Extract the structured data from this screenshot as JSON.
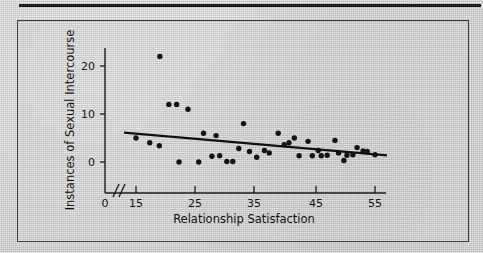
{
  "figure": {
    "background_color": "#cccccc",
    "panel_border_color": "#3a3a3a",
    "rule_color": "#1d1d1d",
    "ink_color": "#141414"
  },
  "chart_data": {
    "type": "scatter",
    "title": "",
    "xlabel": "Relationship Satisfaction",
    "ylabel": "Instances of Sexual Intercourse",
    "xlim": [
      12,
      58
    ],
    "ylim": [
      -4,
      24
    ],
    "xticks": [
      0,
      15,
      25,
      35,
      45,
      55
    ],
    "xtick_labels": [
      "0",
      "15",
      "25",
      "35",
      "45",
      "55"
    ],
    "yticks": [
      0,
      10,
      20
    ],
    "ytick_labels": [
      "0",
      "10",
      "20"
    ],
    "axis_break": true,
    "axis_break_symbol": "//",
    "grid": false,
    "legend": null,
    "marker": "filled-circle",
    "marker_color": "#141414",
    "trendline": {
      "type": "linear-regression",
      "color": "#111111",
      "x_start": 13.0,
      "y_start": 6.1,
      "x_end": 57.0,
      "y_end": 1.4,
      "direction": "negative"
    },
    "points": [
      {
        "x": 15.0,
        "y": 5.0
      },
      {
        "x": 17.3,
        "y": 4.0
      },
      {
        "x": 18.9,
        "y": 3.4
      },
      {
        "x": 19.0,
        "y": 22.0
      },
      {
        "x": 20.5,
        "y": 12.0
      },
      {
        "x": 21.8,
        "y": 12.0
      },
      {
        "x": 22.2,
        "y": 0.0
      },
      {
        "x": 23.7,
        "y": 11.0
      },
      {
        "x": 25.5,
        "y": 0.0
      },
      {
        "x": 26.3,
        "y": 6.0
      },
      {
        "x": 27.7,
        "y": 1.2
      },
      {
        "x": 28.4,
        "y": 5.5
      },
      {
        "x": 29.0,
        "y": 1.3
      },
      {
        "x": 30.2,
        "y": 0.1
      },
      {
        "x": 31.2,
        "y": 0.1
      },
      {
        "x": 32.2,
        "y": 2.8
      },
      {
        "x": 33.0,
        "y": 8.0
      },
      {
        "x": 34.0,
        "y": 2.2
      },
      {
        "x": 35.2,
        "y": 1.0
      },
      {
        "x": 36.5,
        "y": 2.4
      },
      {
        "x": 37.3,
        "y": 1.9
      },
      {
        "x": 38.8,
        "y": 6.0
      },
      {
        "x": 39.8,
        "y": 3.6
      },
      {
        "x": 40.6,
        "y": 4.0
      },
      {
        "x": 41.5,
        "y": 5.0
      },
      {
        "x": 42.3,
        "y": 1.3
      },
      {
        "x": 43.8,
        "y": 4.3
      },
      {
        "x": 44.5,
        "y": 1.3
      },
      {
        "x": 45.5,
        "y": 2.4
      },
      {
        "x": 46.0,
        "y": 1.3
      },
      {
        "x": 47.0,
        "y": 1.4
      },
      {
        "x": 48.3,
        "y": 4.5
      },
      {
        "x": 48.9,
        "y": 1.9
      },
      {
        "x": 49.8,
        "y": 0.3
      },
      {
        "x": 50.3,
        "y": 1.4
      },
      {
        "x": 51.3,
        "y": 1.5
      },
      {
        "x": 52.0,
        "y": 3.0
      },
      {
        "x": 53.0,
        "y": 2.3
      },
      {
        "x": 53.7,
        "y": 2.2
      },
      {
        "x": 55.0,
        "y": 1.5
      }
    ]
  }
}
